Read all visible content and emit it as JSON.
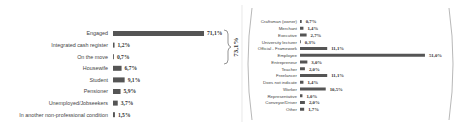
{
  "chart_data": [
    {
      "type": "bar",
      "orientation": "horizontal",
      "title": "",
      "xlabel": "",
      "ylabel": "",
      "categories": [
        "Engaged",
        "Integrated cash register",
        "On the move",
        "Housewife",
        "Student",
        "Pensioner",
        "Unemployed/Jobseekers",
        "In another non-professional condition"
      ],
      "values": [
        71.1,
        1.2,
        0.7,
        6.7,
        9.1,
        5.9,
        3.7,
        1.5
      ],
      "value_labels": [
        "71,1%",
        "1,2%",
        "0,7%",
        "6,7%",
        "9,1%",
        "5,9%",
        "3,7%",
        "1,5%"
      ],
      "bar_color": "#555555",
      "grid": false,
      "annotation": {
        "bracket_covers": [
          "Engaged",
          "Integrated cash register",
          "On the move"
        ],
        "label": "73,1%"
      }
    },
    {
      "type": "bar",
      "orientation": "horizontal",
      "title": "",
      "xlabel": "",
      "ylabel": "",
      "categories": [
        "Craftsman (owner)",
        "Merchant",
        "Executive",
        "University lecturer",
        "Official - Framework",
        "Employee",
        "Entrepreneur",
        "Teacher",
        "Freelancer",
        "Does not indicate",
        "Worker",
        "Representative",
        "Conveyor/Driver",
        "Other"
      ],
      "values": [
        0.7,
        1.4,
        2.7,
        0.3,
        11.1,
        51.0,
        3.0,
        2.0,
        11.1,
        1.4,
        10.5,
        1.0,
        2.0,
        1.7
      ],
      "value_labels": [
        "0,7%",
        "1,4%",
        "2,7%",
        "0,3%",
        "11,1%",
        "51,0%",
        "3,0%",
        "2,0%",
        "11,1%",
        "1,4%",
        "10,5%",
        "1,0%",
        "2,0%",
        "1,7%"
      ],
      "bar_color": "#555555",
      "grid": false,
      "annotation": {
        "enclosed_in": "parentheses",
        "breakdown_of": "Engaged"
      }
    }
  ]
}
